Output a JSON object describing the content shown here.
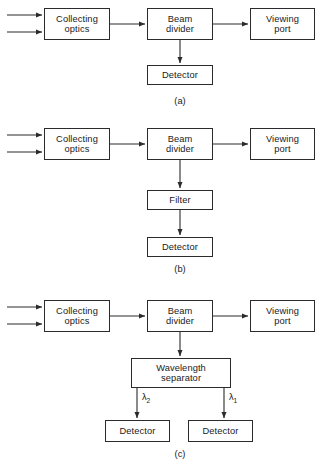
{
  "figure": {
    "type": "block-diagram",
    "line_color": "#2b2b2b",
    "background": "#ffffff"
  },
  "panels": [
    {
      "id": "a",
      "caption": "(a)",
      "blocks": [
        {
          "name": "collecting-optics",
          "lines": [
            "Collecting",
            "optics"
          ]
        },
        {
          "name": "beam-divider",
          "lines": [
            "Beam",
            "divider"
          ]
        },
        {
          "name": "viewing-port",
          "lines": [
            "Viewing",
            "port"
          ]
        },
        {
          "name": "detector",
          "lines": [
            "Detector"
          ]
        }
      ]
    },
    {
      "id": "b",
      "caption": "(b)",
      "blocks": [
        {
          "name": "collecting-optics",
          "lines": [
            "Collecting",
            "optics"
          ]
        },
        {
          "name": "beam-divider",
          "lines": [
            "Beam",
            "divider"
          ]
        },
        {
          "name": "viewing-port",
          "lines": [
            "Viewing",
            "port"
          ]
        },
        {
          "name": "filter",
          "lines": [
            "Filter"
          ]
        },
        {
          "name": "detector",
          "lines": [
            "Detector"
          ]
        }
      ]
    },
    {
      "id": "c",
      "caption": "(c)",
      "blocks": [
        {
          "name": "collecting-optics",
          "lines": [
            "Collecting",
            "optics"
          ]
        },
        {
          "name": "beam-divider",
          "lines": [
            "Beam",
            "divider"
          ]
        },
        {
          "name": "viewing-port",
          "lines": [
            "Viewing",
            "port"
          ]
        },
        {
          "name": "wavelength-separator",
          "lines": [
            "Wavelength",
            "separator"
          ]
        },
        {
          "name": "detector-left",
          "lines": [
            "Detector"
          ]
        },
        {
          "name": "detector-right",
          "lines": [
            "Detector"
          ]
        }
      ],
      "branch_labels": [
        {
          "name": "lambda-2",
          "symbol": "λ",
          "subscript": "2"
        },
        {
          "name": "lambda-1",
          "symbol": "λ",
          "subscript": "1"
        }
      ]
    }
  ],
  "panel_a": {
    "caption": "(a)",
    "collecting_optics_l1": "Collecting",
    "collecting_optics_l2": "optics",
    "beam_divider_l1": "Beam",
    "beam_divider_l2": "divider",
    "viewing_port_l1": "Viewing",
    "viewing_port_l2": "port",
    "detector": "Detector"
  },
  "panel_b": {
    "caption": "(b)",
    "collecting_optics_l1": "Collecting",
    "collecting_optics_l2": "optics",
    "beam_divider_l1": "Beam",
    "beam_divider_l2": "divider",
    "viewing_port_l1": "Viewing",
    "viewing_port_l2": "port",
    "filter": "Filter",
    "detector": "Detector"
  },
  "panel_c": {
    "caption": "(c)",
    "collecting_optics_l1": "Collecting",
    "collecting_optics_l2": "optics",
    "beam_divider_l1": "Beam",
    "beam_divider_l2": "divider",
    "viewing_port_l1": "Viewing",
    "viewing_port_l2": "port",
    "wavelength_separator_l1": "Wavelength",
    "wavelength_separator_l2": "separator",
    "detector_left": "Detector",
    "detector_right": "Detector",
    "lambda_left": "λ",
    "lambda_left_sub": "2",
    "lambda_right": "λ",
    "lambda_right_sub": "1"
  }
}
